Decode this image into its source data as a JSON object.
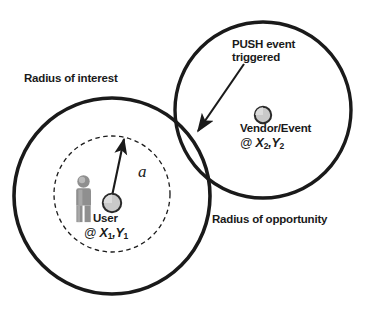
{
  "figure": {
    "type": "concept-diagram",
    "background_color": "#ffffff",
    "stroke_color": "#1a1a1a",
    "marker_fill_color": "#c9c9c9",
    "person_color": "#8a8a8a"
  },
  "labels": {
    "radius_of_interest": "Radius of interest",
    "radius_of_opportunity": "Radius of opportunity",
    "push_event_line1": "PUSH event",
    "push_event_line2": "triggered",
    "vendor_name": "Vendor/Event",
    "vendor_at": "@",
    "vendor_x": "X",
    "vendor_x_sub": "2",
    "vendor_comma": ",",
    "vendor_y": "Y",
    "vendor_y_sub": "2",
    "user_name": "User",
    "user_at": "@",
    "user_x": "X",
    "user_x_sub": "1",
    "user_comma": ",",
    "user_y": "Y",
    "user_y_sub": "1",
    "distance_variable": "a"
  },
  "shapes": {
    "radius_of_interest_circle": {
      "style": "solid",
      "center_x": 112,
      "center_y": 196,
      "radius": 98
    },
    "radius_of_opportunity_circle": {
      "style": "solid",
      "center_x": 263,
      "center_y": 110,
      "radius": 88
    },
    "inner_dashed_circle": {
      "style": "dashed",
      "center_x": 112,
      "center_y": 194,
      "radius": 58
    },
    "user_marker": {
      "center_x": 112,
      "center_y": 203,
      "radius": 9
    },
    "vendor_marker": {
      "center_x": 263,
      "center_y": 115,
      "radius": 8
    },
    "distance_arrow": {
      "from_x": 112,
      "from_y": 194,
      "to_x": 124,
      "to_y": 137
    },
    "push_event_arrow": {
      "from_x": 243,
      "from_y": 66,
      "to_x": 196,
      "to_y": 133
    }
  }
}
